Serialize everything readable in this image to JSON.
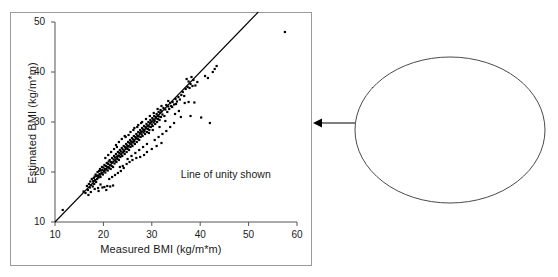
{
  "figure": {
    "background": "#ffffff",
    "border_color": "#9a9a9a",
    "axis_color": "#555555",
    "point_color": "#000000",
    "line_color": "#000000"
  },
  "plot": {
    "note": "Line of unity shown",
    "unity_line": {
      "from": [
        10,
        10
      ],
      "to": [
        52,
        52
      ]
    }
  },
  "callout": {
    "lines": [
      "The scattergram indicates",
      "close positive association",
      "between patient-assessed",
      "and clinic-measured BMI."
    ],
    "shape": "ellipse",
    "connector": "arrow-left"
  },
  "chart_data": {
    "type": "scatter",
    "title": "",
    "xlabel": "Measured BMI (kg/m*m)",
    "ylabel": "Estimated BMI (kg/m*m)",
    "xlim": [
      10,
      60
    ],
    "ylim": [
      10,
      50
    ],
    "xticks": [
      10,
      20,
      30,
      40,
      50,
      60
    ],
    "yticks": [
      10,
      20,
      30,
      40,
      50
    ],
    "xticklabels": [
      "10",
      "20",
      "30",
      "40",
      "50",
      "60"
    ],
    "yticklabels": [
      "10",
      "20",
      "30",
      "40",
      "50"
    ],
    "grid": false,
    "legend": null,
    "annotations": [
      {
        "text": "Line of unity shown",
        "x": 36,
        "y": 19.5
      }
    ],
    "reference_line": {
      "name": "Line of unity",
      "slope": 1,
      "intercept": 0,
      "x_range": [
        10,
        52
      ]
    },
    "series": [
      {
        "name": "Patients",
        "marker": "filled-square",
        "color": "#000000",
        "points": [
          [
            11.6,
            12.4
          ],
          [
            15.9,
            16.1
          ],
          [
            16.3,
            15.8
          ],
          [
            16.6,
            17.2
          ],
          [
            16.8,
            16.4
          ],
          [
            17.0,
            17.6
          ],
          [
            17.2,
            16.9
          ],
          [
            17.3,
            18.1
          ],
          [
            17.5,
            17.4
          ],
          [
            17.6,
            18.6
          ],
          [
            17.8,
            17.1
          ],
          [
            17.9,
            18.2
          ],
          [
            18.0,
            18.8
          ],
          [
            18.1,
            17.6
          ],
          [
            18.2,
            19.1
          ],
          [
            18.3,
            18.4
          ],
          [
            18.4,
            19.5
          ],
          [
            18.5,
            18.0
          ],
          [
            18.6,
            19.2
          ],
          [
            18.7,
            18.6
          ],
          [
            18.8,
            20.0
          ],
          [
            18.9,
            19.3
          ],
          [
            19.0,
            18.9
          ],
          [
            19.1,
            20.2
          ],
          [
            19.2,
            19.6
          ],
          [
            19.3,
            20.6
          ],
          [
            19.4,
            19.0
          ],
          [
            19.5,
            20.3
          ],
          [
            19.6,
            19.8
          ],
          [
            19.7,
            21.0
          ],
          [
            19.8,
            20.4
          ],
          [
            19.9,
            19.5
          ],
          [
            20.0,
            20.9
          ],
          [
            20.1,
            20.2
          ],
          [
            20.2,
            21.4
          ],
          [
            20.3,
            20.6
          ],
          [
            20.4,
            19.9
          ],
          [
            20.5,
            21.2
          ],
          [
            20.6,
            20.5
          ],
          [
            20.7,
            21.8
          ],
          [
            20.8,
            21.0
          ],
          [
            20.9,
            20.3
          ],
          [
            21.0,
            21.6
          ],
          [
            21.1,
            22.1
          ],
          [
            21.2,
            20.8
          ],
          [
            21.3,
            22.4
          ],
          [
            21.4,
            21.4
          ],
          [
            21.5,
            20.6
          ],
          [
            21.6,
            22.0
          ],
          [
            21.7,
            21.2
          ],
          [
            21.8,
            22.8
          ],
          [
            21.9,
            21.9
          ],
          [
            22.0,
            21.0
          ],
          [
            22.1,
            22.5
          ],
          [
            22.2,
            23.2
          ],
          [
            22.3,
            21.7
          ],
          [
            22.4,
            22.9
          ],
          [
            22.5,
            22.2
          ],
          [
            22.6,
            23.6
          ],
          [
            22.7,
            22.0
          ],
          [
            22.8,
            23.1
          ],
          [
            22.9,
            22.6
          ],
          [
            23.0,
            24.0
          ],
          [
            23.1,
            23.3
          ],
          [
            23.2,
            22.4
          ],
          [
            23.3,
            23.8
          ],
          [
            23.4,
            24.4
          ],
          [
            23.5,
            23.0
          ],
          [
            23.6,
            24.1
          ],
          [
            23.7,
            23.5
          ],
          [
            23.8,
            24.8
          ],
          [
            23.9,
            23.2
          ],
          [
            24.0,
            24.5
          ],
          [
            24.1,
            23.9
          ],
          [
            24.2,
            25.2
          ],
          [
            24.3,
            24.2
          ],
          [
            24.4,
            23.6
          ],
          [
            24.5,
            25.0
          ],
          [
            24.6,
            24.7
          ],
          [
            24.7,
            25.6
          ],
          [
            24.8,
            24.0
          ],
          [
            24.9,
            25.3
          ],
          [
            25.0,
            24.6
          ],
          [
            25.1,
            26.0
          ],
          [
            25.2,
            25.1
          ],
          [
            25.3,
            24.4
          ],
          [
            25.4,
            25.8
          ],
          [
            25.5,
            26.4
          ],
          [
            25.6,
            25.0
          ],
          [
            25.7,
            26.1
          ],
          [
            25.8,
            25.5
          ],
          [
            25.9,
            26.8
          ],
          [
            26.0,
            25.2
          ],
          [
            26.1,
            26.5
          ],
          [
            26.2,
            25.9
          ],
          [
            26.3,
            27.2
          ],
          [
            26.4,
            26.2
          ],
          [
            26.5,
            25.6
          ],
          [
            26.6,
            27.0
          ],
          [
            26.7,
            26.7
          ],
          [
            26.8,
            27.6
          ],
          [
            26.9,
            26.0
          ],
          [
            27.0,
            27.3
          ],
          [
            27.1,
            26.6
          ],
          [
            27.2,
            28.0
          ],
          [
            27.3,
            27.1
          ],
          [
            27.4,
            26.4
          ],
          [
            27.5,
            27.8
          ],
          [
            27.6,
            28.4
          ],
          [
            27.7,
            27.0
          ],
          [
            27.8,
            28.1
          ],
          [
            27.9,
            27.5
          ],
          [
            28.0,
            28.8
          ],
          [
            28.1,
            27.2
          ],
          [
            28.2,
            28.5
          ],
          [
            28.3,
            27.9
          ],
          [
            28.4,
            29.2
          ],
          [
            28.5,
            28.2
          ],
          [
            28.6,
            27.6
          ],
          [
            28.7,
            29.0
          ],
          [
            28.8,
            28.7
          ],
          [
            28.9,
            29.6
          ],
          [
            29.0,
            28.0
          ],
          [
            29.1,
            29.3
          ],
          [
            29.2,
            28.6
          ],
          [
            29.3,
            30.0
          ],
          [
            29.4,
            29.1
          ],
          [
            29.5,
            28.4
          ],
          [
            29.6,
            29.8
          ],
          [
            29.7,
            30.4
          ],
          [
            29.8,
            29.0
          ],
          [
            29.9,
            30.1
          ],
          [
            30.0,
            29.5
          ],
          [
            30.1,
            30.8
          ],
          [
            30.2,
            29.2
          ],
          [
            30.3,
            30.5
          ],
          [
            30.4,
            29.9
          ],
          [
            30.5,
            31.2
          ],
          [
            30.6,
            30.2
          ],
          [
            30.7,
            29.6
          ],
          [
            30.8,
            31.0
          ],
          [
            30.9,
            30.7
          ],
          [
            31.0,
            31.6
          ],
          [
            31.1,
            30.0
          ],
          [
            31.2,
            31.3
          ],
          [
            31.3,
            30.6
          ],
          [
            31.4,
            32.0
          ],
          [
            31.5,
            31.1
          ],
          [
            31.6,
            30.4
          ],
          [
            31.7,
            31.8
          ],
          [
            31.8,
            32.4
          ],
          [
            31.9,
            31.0
          ],
          [
            32.0,
            32.1
          ],
          [
            32.2,
            31.5
          ],
          [
            32.4,
            32.8
          ],
          [
            32.6,
            31.2
          ],
          [
            32.8,
            32.5
          ],
          [
            33.0,
            33.4
          ],
          [
            33.2,
            32.0
          ],
          [
            33.4,
            33.1
          ],
          [
            33.6,
            32.6
          ],
          [
            33.8,
            33.8
          ],
          [
            34.0,
            33.2
          ],
          [
            34.3,
            34.0
          ],
          [
            34.6,
            33.5
          ],
          [
            34.9,
            34.6
          ],
          [
            35.2,
            34.1
          ],
          [
            35.5,
            35.0
          ],
          [
            35.8,
            34.5
          ],
          [
            36.1,
            35.4
          ],
          [
            36.4,
            36.0
          ],
          [
            36.7,
            35.2
          ],
          [
            37.0,
            36.6
          ],
          [
            37.2,
            38.6
          ],
          [
            37.4,
            37.0
          ],
          [
            37.6,
            38.1
          ],
          [
            37.8,
            36.8
          ],
          [
            38.0,
            37.6
          ],
          [
            38.2,
            39.0
          ],
          [
            38.4,
            37.2
          ],
          [
            38.6,
            38.4
          ],
          [
            38.8,
            33.9
          ],
          [
            39.0,
            37.3
          ],
          [
            39.4,
            38.0
          ],
          [
            40.2,
            30.9
          ],
          [
            41.0,
            39.2
          ],
          [
            41.6,
            38.8
          ],
          [
            42.0,
            29.8
          ],
          [
            42.6,
            40.0
          ],
          [
            43.0,
            40.6
          ],
          [
            43.4,
            41.2
          ],
          [
            57.5,
            48.0
          ],
          [
            20.2,
            17.0
          ],
          [
            20.8,
            17.2
          ],
          [
            21.4,
            17.1
          ],
          [
            22.0,
            17.3
          ],
          [
            19.4,
            17.5
          ],
          [
            18.9,
            16.8
          ],
          [
            23.4,
            21.0
          ],
          [
            24.0,
            21.2
          ],
          [
            24.8,
            21.6
          ],
          [
            25.4,
            22.0
          ],
          [
            26.0,
            22.4
          ],
          [
            26.8,
            22.8
          ],
          [
            27.6,
            23.0
          ],
          [
            28.4,
            23.4
          ],
          [
            29.0,
            24.0
          ],
          [
            30.0,
            24.6
          ],
          [
            31.0,
            25.2
          ],
          [
            32.0,
            25.8
          ],
          [
            30.6,
            26.4
          ],
          [
            31.4,
            27.0
          ],
          [
            32.2,
            27.6
          ],
          [
            33.0,
            28.2
          ],
          [
            33.8,
            29.0
          ],
          [
            34.6,
            29.8
          ],
          [
            22.6,
            25.4
          ],
          [
            23.2,
            26.0
          ],
          [
            24.4,
            27.2
          ],
          [
            25.6,
            28.0
          ],
          [
            26.4,
            28.8
          ],
          [
            27.2,
            29.4
          ],
          [
            28.0,
            30.0
          ],
          [
            28.8,
            30.6
          ],
          [
            29.6,
            31.2
          ],
          [
            30.4,
            31.8
          ],
          [
            31.2,
            32.6
          ],
          [
            32.0,
            33.2
          ],
          [
            33.4,
            34.2
          ],
          [
            34.2,
            33.0
          ],
          [
            35.0,
            33.6
          ],
          [
            36.0,
            31.0
          ],
          [
            36.8,
            33.8
          ],
          [
            38.0,
            31.2
          ],
          [
            16.9,
            15.4
          ],
          [
            17.4,
            16.0
          ],
          [
            18.2,
            16.6
          ],
          [
            19.0,
            16.2
          ],
          [
            19.8,
            16.9
          ],
          [
            20.6,
            16.4
          ],
          [
            21.2,
            18.6
          ],
          [
            21.8,
            19.0
          ],
          [
            22.4,
            19.4
          ],
          [
            23.0,
            19.8
          ],
          [
            23.6,
            20.2
          ],
          [
            24.2,
            20.8
          ],
          [
            25.0,
            22.6
          ],
          [
            25.8,
            23.2
          ],
          [
            26.6,
            23.8
          ],
          [
            27.4,
            24.4
          ],
          [
            28.2,
            25.0
          ],
          [
            29.0,
            25.6
          ],
          [
            20.4,
            22.8
          ],
          [
            21.0,
            23.4
          ],
          [
            21.6,
            24.0
          ],
          [
            22.2,
            24.6
          ],
          [
            22.8,
            25.0
          ],
          [
            23.8,
            26.6
          ],
          [
            24.6,
            27.0
          ],
          [
            25.2,
            27.4
          ],
          [
            26.2,
            28.4
          ],
          [
            27.0,
            29.0
          ],
          [
            27.8,
            29.8
          ],
          [
            29.4,
            27.8
          ],
          [
            30.2,
            28.4
          ],
          [
            31.6,
            29.0
          ],
          [
            32.8,
            30.2
          ],
          [
            34.8,
            31.6
          ],
          [
            35.6,
            32.2
          ],
          [
            37.6,
            34.0
          ]
        ]
      }
    ]
  }
}
